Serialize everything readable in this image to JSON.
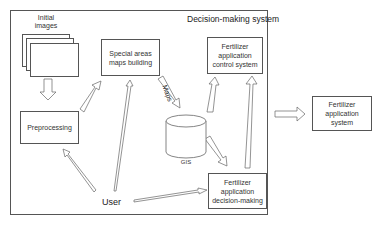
{
  "diagram": {
    "system_title": "Decision-making system",
    "nodes": {
      "initial_images": "Initial images",
      "special_areas": "Special areas maps building",
      "control_system": "Fertilizer application control system",
      "preprocessing": "Preprocessing",
      "gis": "GIS",
      "decision_making": "Fertilizer application decision-making",
      "application_system": "Fertilizer application system",
      "user": "User"
    },
    "edge_labels": {
      "maps": "Maps"
    },
    "edges": [
      {
        "from": "initial_images",
        "to": "preprocessing"
      },
      {
        "from": "preprocessing",
        "to": "special_areas"
      },
      {
        "from": "user",
        "to": "special_areas"
      },
      {
        "from": "user",
        "to": "preprocessing"
      },
      {
        "from": "user",
        "to": "decision_making"
      },
      {
        "from": "special_areas",
        "to": "gis",
        "label": "Maps"
      },
      {
        "from": "gis",
        "to": "control_system"
      },
      {
        "from": "gis",
        "to": "decision_making"
      },
      {
        "from": "decision_making",
        "to": "control_system"
      },
      {
        "from": "decision_making_system",
        "to": "application_system"
      }
    ]
  }
}
